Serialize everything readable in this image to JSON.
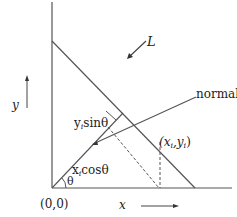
{
  "diagram": {
    "labels": {
      "line": "L",
      "normal": "normal",
      "y_axis": "y",
      "x_axis": "x",
      "origin": "(0,0)",
      "point": "(x",
      "point_sub_i": "i",
      "point_mid": ",y",
      "point_sub_i2": "i",
      "point_close": ")",
      "y_sin": "y",
      "y_sin_sub": "i",
      "y_sin_rest": "sinθ",
      "x_cos": "x",
      "x_cos_sub": "i",
      "x_cos_rest": "cosθ",
      "theta": "θ"
    },
    "colors": {
      "stroke": "#555555",
      "text": "#222222"
    }
  }
}
